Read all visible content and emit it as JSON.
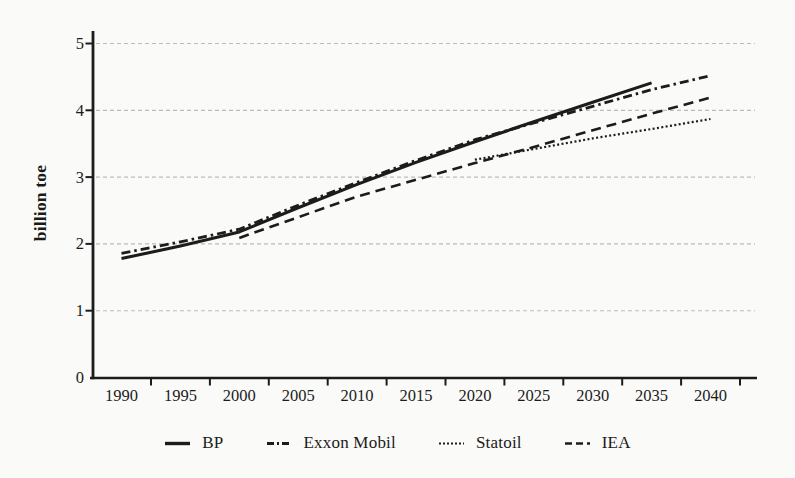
{
  "colors": {
    "line": "#1c1c1c",
    "grid": "#bcbcbc",
    "background": "#fafaf8"
  },
  "chart_data": {
    "type": "line",
    "title": "",
    "xlabel": "",
    "ylabel": "billion toe",
    "ylim": [
      0,
      5
    ],
    "xlim": [
      1990,
      2040
    ],
    "yticks": [
      0,
      1,
      2,
      3,
      4,
      5
    ],
    "xticks": [
      1990,
      1995,
      2000,
      2005,
      2010,
      2015,
      2020,
      2025,
      2030,
      2035,
      2040
    ],
    "grid": "horizontal dotted gridlines at each integer",
    "legend_position": "bottom",
    "series": [
      {
        "name": "BP",
        "style": "solid",
        "x": [
          1990,
          1995,
          2000,
          2005,
          2010,
          2015,
          2020,
          2025,
          2030,
          2035
        ],
        "values": [
          1.78,
          1.97,
          2.18,
          2.54,
          2.89,
          3.22,
          3.53,
          3.83,
          4.12,
          4.41
        ]
      },
      {
        "name": "Exxon Mobil",
        "style": "dashdot",
        "x": [
          1990,
          1995,
          2000,
          2005,
          2010,
          2015,
          2020,
          2025,
          2030,
          2035,
          2040
        ],
        "values": [
          1.86,
          2.03,
          2.22,
          2.58,
          2.92,
          3.25,
          3.56,
          3.81,
          4.06,
          4.31,
          4.52
        ]
      },
      {
        "name": "Statoil",
        "style": "dotted",
        "x": [
          2020,
          2025,
          2030,
          2035,
          2040
        ],
        "values": [
          3.26,
          3.42,
          3.58,
          3.72,
          3.87
        ]
      },
      {
        "name": "IEA",
        "style": "dashed",
        "x": [
          2000,
          2005,
          2010,
          2015,
          2020,
          2025,
          2030,
          2035,
          2040
        ],
        "values": [
          2.09,
          2.4,
          2.71,
          2.96,
          3.21,
          3.45,
          3.7,
          3.95,
          4.19
        ]
      }
    ]
  }
}
